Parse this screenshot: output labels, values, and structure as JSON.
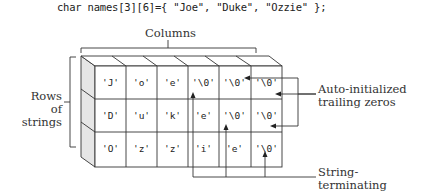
{
  "code": "char names[3][6]={ \"Joe\", \"Duke\", \"Ozzie\" };",
  "labels": {
    "columns": "Columns",
    "rows": [
      "Rows of",
      "strings"
    ],
    "auto_init": [
      "Auto-initialized",
      "trailing zeros"
    ],
    "string_term": [
      "String-terminating",
      "zeros"
    ]
  },
  "grid": {
    "rows": [
      [
        "'J'",
        "'o'",
        "'e'",
        "'\\0'",
        "'\\0'",
        "'\\0'"
      ],
      [
        "'D'",
        "'u'",
        "'k'",
        "'e'",
        "'\\0'",
        "'\\0'"
      ],
      [
        "'O'",
        "'z'",
        "'z'",
        "'i'",
        "'e'",
        "'\\0'"
      ]
    ]
  },
  "colors": {
    "line": "#333333",
    "side_face": "#e6e6e6",
    "text": "#222222"
  }
}
